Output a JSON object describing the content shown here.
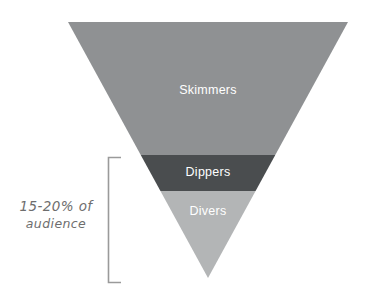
{
  "diagram": {
    "type": "inverted-funnel",
    "title": "",
    "shape": {
      "apex_x": 208,
      "apex_y": 278,
      "top_left_x": 68,
      "top_right_x": 348,
      "top_y": 22
    },
    "segments": [
      {
        "id": "skimmers",
        "label": "Skimmers",
        "color": "#8f9193",
        "label_color": "#ffffff",
        "y_start": 22,
        "y_end": 155,
        "order": 1
      },
      {
        "id": "dippers",
        "label": "Dippers",
        "color": "#4a4d4f",
        "label_color": "#ffffff",
        "y_start": 155,
        "y_end": 191,
        "order": 2
      },
      {
        "id": "divers",
        "label": "Divers",
        "color": "#b3b5b6",
        "label_color": "#ffffff",
        "y_start": 191,
        "y_end": 278,
        "order": 3
      }
    ],
    "annotation": {
      "id": "audience-share-callout",
      "line1": "15-20% of",
      "line2": "audience",
      "text": "15-20% of audience",
      "color": "#6e6e6e",
      "covers_segments": [
        "dippers",
        "divers"
      ],
      "bracket": {
        "color": "#9a9a9a",
        "x": 108,
        "arm_end_x": 121,
        "y_top": 157,
        "y_bottom": 283
      }
    }
  }
}
